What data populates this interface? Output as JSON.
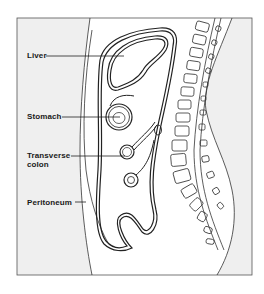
{
  "diagram": {
    "type": "anatomical sagittal section of abdomen",
    "labels": [
      {
        "id": "liver",
        "text": "Liver"
      },
      {
        "id": "stomach",
        "text": "Stomach"
      },
      {
        "id": "transverse_colon",
        "text": "Transverse\ncolon"
      },
      {
        "id": "peritoneum",
        "text": "Peritoneum"
      }
    ],
    "colors": {
      "background": "#ffffff",
      "outside_body": "#efefef",
      "line": "#2a2a2a",
      "frame": "#555555"
    }
  }
}
